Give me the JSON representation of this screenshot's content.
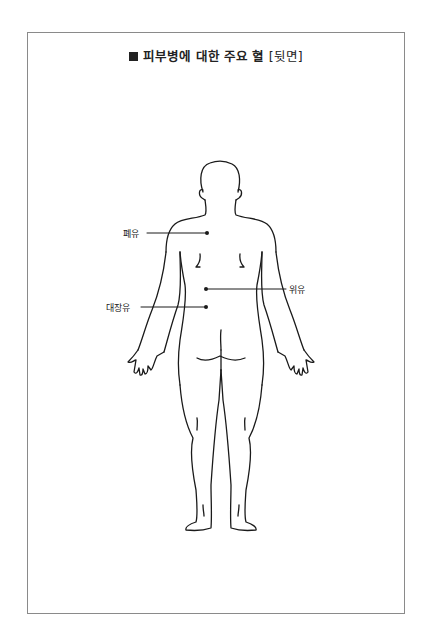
{
  "page_header_bleed": "",
  "figure": {
    "title_marker": "■",
    "title": "피부병에 대한 주요 혈",
    "title_suffix": "[뒷면]",
    "view": "back",
    "points": [
      {
        "label": "폐유",
        "side": "left",
        "dot": [
          207,
          233
        ]
      },
      {
        "label": "위유",
        "side": "right",
        "dot": [
          206,
          289
        ]
      },
      {
        "label": "대장유",
        "side": "left",
        "dot": [
          206,
          307
        ]
      }
    ]
  },
  "colors": {
    "line": "#1a1a1a",
    "frame": "#8a8a8a",
    "background": "#ffffff"
  }
}
